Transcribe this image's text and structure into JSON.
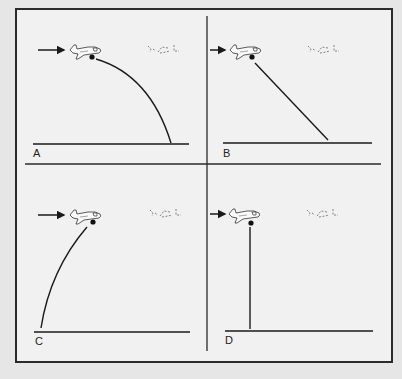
{
  "figure": {
    "panels": [
      {
        "id": "A",
        "label": "A",
        "trajectory": "curved-forward-down"
      },
      {
        "id": "B",
        "label": "B",
        "trajectory": "straight-diagonal-forward"
      },
      {
        "id": "C",
        "label": "C",
        "trajectory": "curved-backward-down"
      },
      {
        "id": "D",
        "label": "D",
        "trajectory": "straight-vertical-down"
      }
    ],
    "icons": {
      "direction": "arrow-right-icon",
      "airplane": "airplane-icon",
      "ghost_airplane": "faded-airplane-icon",
      "dropped_object": "dot-icon"
    },
    "colors": {
      "line": "#1a1a1a",
      "background": "#f1f1f1",
      "page": "#e6e6e6",
      "ghost": "#9a9a9a"
    }
  }
}
